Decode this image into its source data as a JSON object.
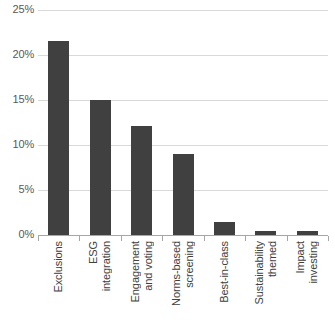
{
  "chart_data": {
    "type": "bar",
    "title": "",
    "xlabel": "",
    "ylabel": "",
    "categories": [
      "Exclusions",
      "ESG integration",
      "Engagement and voting",
      "Norms-based screening",
      "Best-in-class",
      "Sustainability themed",
      "Impact investing"
    ],
    "category_lines": [
      [
        "Exclusions"
      ],
      [
        "ESG",
        "integration"
      ],
      [
        "Engagement",
        "and voting"
      ],
      [
        "Norms-based",
        "screening"
      ],
      [
        "Best-in-class"
      ],
      [
        "Sustainability",
        "themed"
      ],
      [
        "Impact",
        "investing"
      ]
    ],
    "values": [
      21.6,
      15.0,
      12.1,
      9.0,
      1.4,
      0.5,
      0.4
    ],
    "ylim": [
      0,
      25
    ],
    "ytick_values": [
      0,
      5,
      10,
      15,
      20,
      25
    ],
    "ytick_labels": [
      "0%",
      "5%",
      "10%",
      "15%",
      "20%",
      "25%"
    ],
    "grid": true,
    "legend": false,
    "bar_color": "#404040",
    "gridline_color": "#d9d9d9",
    "axis_color": "#a6a6a6",
    "tick_label_color": "#595959",
    "category_label_color": "#404040"
  }
}
